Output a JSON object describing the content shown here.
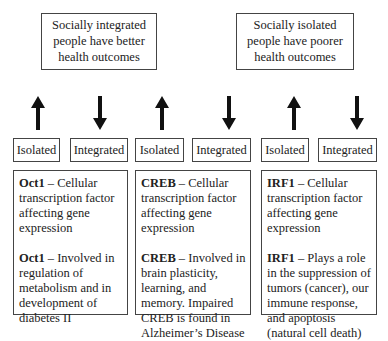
{
  "top_boxes": [
    {
      "text": "Socially integrated people have better health outcomes"
    },
    {
      "text": "Socially isolated people have poorer health outcomes"
    }
  ],
  "arrows": [
    "up",
    "down",
    "up",
    "down",
    "up",
    "down"
  ],
  "labels": [
    "Isolated",
    "Integrated",
    "Isolated",
    "Integrated",
    "Isolated",
    "Integrated"
  ],
  "columns": [
    {
      "gene": "Oct1",
      "dash": " – ",
      "line1": "Cellular transcription factor affecting gene expression",
      "line2": "Involved in regulation of metabolism and in development of diabetes II"
    },
    {
      "gene": "CREB",
      "dash": " – ",
      "line1": "Cellular transcription factor affecting gene expression",
      "line2": "Involved in brain plasticity, learning, and memory. Impaired CREB is found in Alzheimer’s Disease"
    },
    {
      "gene": "IRF1",
      "dash": " – ",
      "line1": "Cellular transcription factor affecting gene expression",
      "line2": "Plays a role in the suppression of tumors (cancer), our immune response, and apoptosis (natural cell death)"
    }
  ]
}
